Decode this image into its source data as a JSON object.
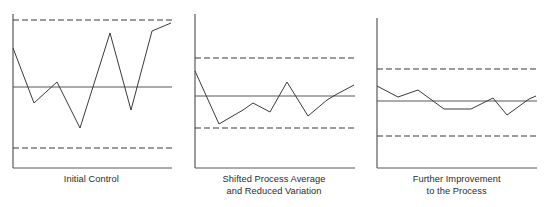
{
  "figure": {
    "type": "spc-control-chart-series",
    "background_color": "#ffffff",
    "line_color": "#3a3a3a",
    "axis_color": "#595959",
    "limit_color": "#3a3a3a",
    "caption_color": "#2b2b2b"
  },
  "panels": [
    {
      "id": "initial-control",
      "caption_lines": [
        "Initial Control"
      ],
      "chart_data": {
        "type": "line",
        "title": "Initial Control",
        "xlabel": "",
        "ylabel": "",
        "grid": false,
        "legend": "none",
        "ylim": [
          0,
          100
        ],
        "center_line": 50,
        "upper_control_limit": 95,
        "lower_control_limit": 5,
        "x": [
          1,
          2,
          3,
          4,
          5,
          6,
          7,
          8,
          9,
          10,
          11
        ],
        "values": [
          79,
          43,
          51,
          39,
          28,
          12,
          60,
          89,
          36,
          89,
          94
        ],
        "axis_px": {
          "y_axis_x": 13,
          "axis_top_y": 14,
          "baseline_y": 168,
          "plot_right_x": 172,
          "ucl_y": 20,
          "center_y": 87,
          "lcl_y": 148
        },
        "points_px": [
          [
            13,
            48
          ],
          [
            34,
            103
          ],
          [
            46,
            92
          ],
          [
            57,
            82
          ],
          [
            80,
            128
          ],
          [
            110,
            33
          ],
          [
            131,
            110
          ],
          [
            152,
            31
          ],
          [
            171,
            23
          ]
        ]
      }
    },
    {
      "id": "shifted-process-average",
      "caption_lines": [
        "Shifted Process Average",
        "and Reduced Variation"
      ],
      "chart_data": {
        "type": "line",
        "title": "Shifted Process Average and Reduced Variation",
        "xlabel": "",
        "ylabel": "",
        "grid": false,
        "legend": "none",
        "ylim": [
          0,
          100
        ],
        "center_line": 50,
        "upper_control_limit": 85,
        "lower_control_limit": 15,
        "x": [
          1,
          2,
          3,
          4,
          5,
          6,
          7,
          8,
          9,
          10
        ],
        "values": [
          69,
          26,
          38,
          44,
          37,
          63,
          33,
          47,
          55,
          57
        ],
        "axis_px": {
          "y_axis_x": 195,
          "axis_top_y": 14,
          "baseline_y": 168,
          "plot_right_x": 355,
          "ucl_y": 58,
          "center_y": 96,
          "lcl_y": 128
        },
        "points_px": [
          [
            195,
            71
          ],
          [
            219,
            124
          ],
          [
            243,
            110
          ],
          [
            253,
            103
          ],
          [
            270,
            112
          ],
          [
            287,
            82
          ],
          [
            308,
            116
          ],
          [
            327,
            100
          ],
          [
            337,
            94
          ],
          [
            354,
            85
          ]
        ]
      }
    },
    {
      "id": "further-improvement",
      "caption_lines": [
        "Further Improvement",
        "to the Process"
      ],
      "chart_data": {
        "type": "line",
        "title": "Further Improvement to the Process",
        "xlabel": "",
        "ylabel": "",
        "grid": false,
        "legend": "none",
        "ylim": [
          0,
          100
        ],
        "center_line": 50,
        "upper_control_limit": 78,
        "lower_control_limit": 22,
        "x": [
          1,
          2,
          3,
          4,
          5,
          6,
          7,
          8,
          9,
          10,
          11
        ],
        "values": [
          58,
          48,
          54,
          41,
          41,
          41,
          52,
          38,
          52,
          52
        ],
        "axis_px": {
          "y_axis_x": 378,
          "axis_top_y": 18,
          "baseline_y": 168,
          "plot_right_x": 538,
          "ucl_y": 69,
          "center_y": 101,
          "lcl_y": 136
        },
        "points_px": [
          [
            378,
            86
          ],
          [
            399,
            97
          ],
          [
            419,
            90
          ],
          [
            445,
            109
          ],
          [
            472,
            109
          ],
          [
            494,
            98
          ],
          [
            508,
            115
          ],
          [
            530,
            99
          ],
          [
            537,
            96
          ]
        ]
      }
    }
  ]
}
